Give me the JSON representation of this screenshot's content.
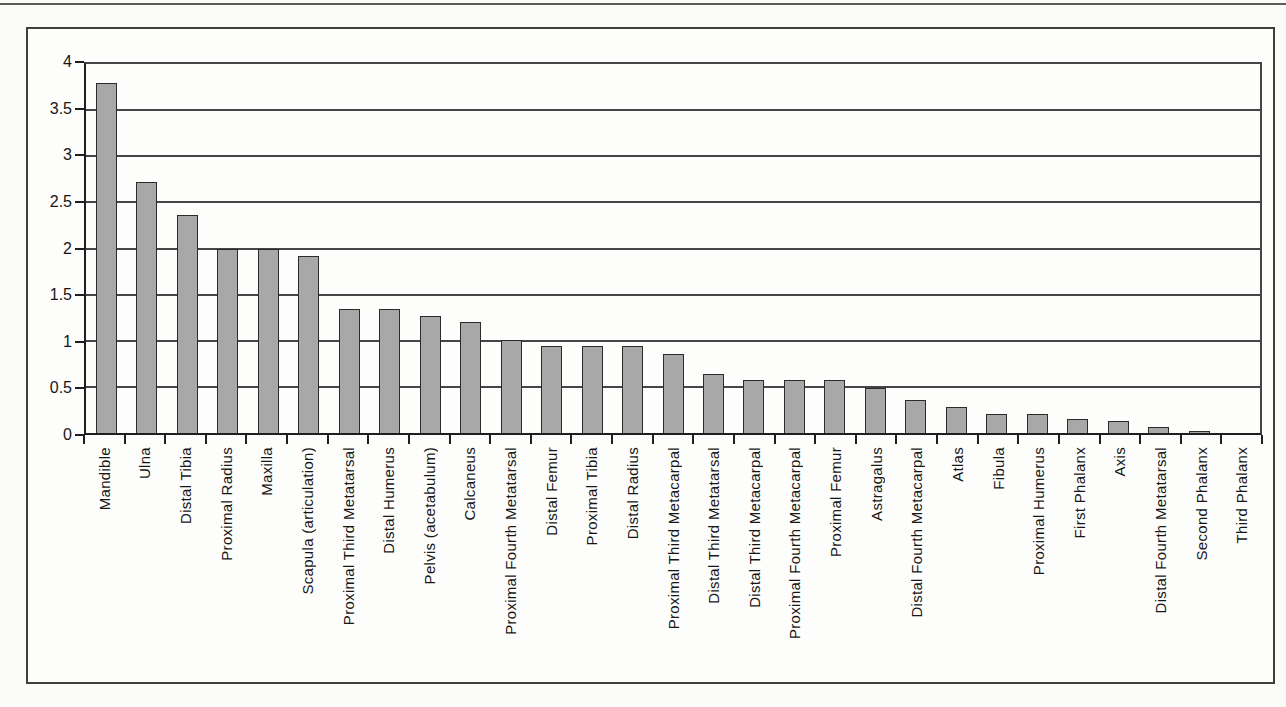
{
  "chart_data": {
    "type": "bar",
    "title": "",
    "xlabel": "",
    "ylabel": "",
    "legend": "none",
    "grid": "horizontal",
    "ylim": [
      0,
      4
    ],
    "ytick_values": [
      0,
      0.5,
      1,
      1.5,
      2,
      2.5,
      3,
      3.5,
      4
    ],
    "ytick_labels": [
      "0",
      "0.5",
      "1",
      "1.5",
      "2",
      "2.5",
      "3",
      "3.5",
      "4"
    ],
    "gridline_values": [
      0.5,
      1,
      1.5,
      2,
      2.5,
      3,
      3.5
    ],
    "bar_fill_color": "#a8a8a8",
    "bar_border_color": "#2b2b2b",
    "categories": [
      "Mandible",
      "Ulna",
      "Distal Tibia",
      "Proximal Radius",
      "Maxilla",
      "Scapula (articulation)",
      "Proximal Third Metatarsal",
      "Distal Humerus",
      "Pelvis (acetabulum)",
      "Calcaneus",
      "Proximal Fourth Metatarsal",
      "Distal Femur",
      "Proximal Tibia",
      "Distal Radius",
      "Proximal Third Metacarpal",
      "Distal Third Metatarsal",
      "Distal Third Metacarpal",
      "Proximal Fourth Metacarpal",
      "Proximal Femur",
      "Astragalus",
      "Distal Fourth Metacarpal",
      "Atlas",
      "Fibula",
      "Proximal Humerus",
      "First Phalanx",
      "Axis",
      "Distal Fourth Metatarsal",
      "Second Phalanx",
      "Third Phalanx"
    ],
    "values": [
      3.79,
      2.72,
      2.36,
      2.0,
      2.0,
      1.92,
      1.34,
      1.34,
      1.27,
      1.2,
      1.01,
      0.94,
      0.94,
      0.94,
      0.86,
      0.64,
      0.57,
      0.57,
      0.57,
      0.49,
      0.36,
      0.28,
      0.21,
      0.21,
      0.15,
      0.13,
      0.06,
      0.02,
      0.0
    ]
  }
}
